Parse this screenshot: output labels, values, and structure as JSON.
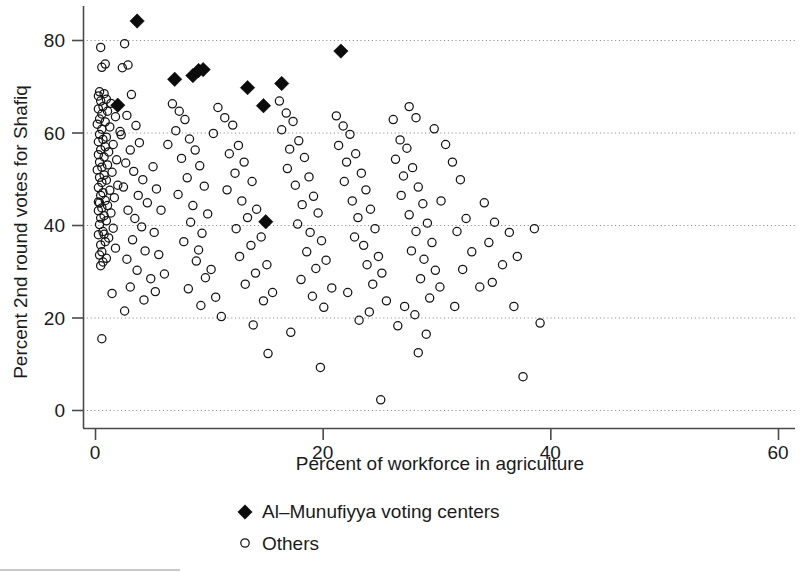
{
  "chart_data": {
    "type": "scatter",
    "title": "",
    "xlabel": "Percent of workforce in agriculture",
    "ylabel": "Percent 2nd round votes for Shafiq",
    "xlim": [
      0,
      60
    ],
    "ylim": [
      0,
      88
    ],
    "xticks": [
      0,
      20,
      40,
      60
    ],
    "yticks": [
      0,
      20,
      40,
      60,
      80
    ],
    "xtick_labels": [
      "0",
      "20",
      "40",
      "60"
    ],
    "ytick_labels": [
      "0",
      "20",
      "40",
      "60",
      "80"
    ],
    "grid": "horizontal-dotted",
    "legend_position": "below-axis-center",
    "series": [
      {
        "name": "Al–Munufiyya voting centers",
        "marker": "filled-diamond",
        "color": "#0b0b0b",
        "points": [
          [
            3.7,
            84.1
          ],
          [
            2.0,
            65.9
          ],
          [
            7.0,
            71.5
          ],
          [
            8.6,
            72.3
          ],
          [
            9.1,
            73.4
          ],
          [
            9.5,
            73.6
          ],
          [
            13.4,
            69.7
          ],
          [
            14.8,
            65.8
          ],
          [
            16.4,
            70.6
          ],
          [
            21.6,
            77.6
          ],
          [
            15.0,
            40.7
          ]
        ]
      },
      {
        "name": "Others",
        "marker": "open-circle",
        "color": "#141414",
        "points": [
          [
            0.5,
            78.4
          ],
          [
            0.9,
            74.8
          ],
          [
            0.6,
            74.1
          ],
          [
            0.4,
            68.8
          ],
          [
            0.8,
            68.4
          ],
          [
            0.3,
            67.9
          ],
          [
            1.0,
            67.2
          ],
          [
            0.5,
            66.8
          ],
          [
            1.4,
            66.3
          ],
          [
            0.7,
            65.6
          ],
          [
            0.3,
            65.1
          ],
          [
            1.1,
            64.6
          ],
          [
            0.6,
            64.0
          ],
          [
            1.8,
            63.4
          ],
          [
            0.4,
            62.9
          ],
          [
            0.9,
            62.3
          ],
          [
            0.2,
            61.8
          ],
          [
            1.3,
            61.2
          ],
          [
            0.6,
            60.7
          ],
          [
            2.2,
            60.2
          ],
          [
            0.4,
            59.6
          ],
          [
            1.0,
            59.0
          ],
          [
            0.7,
            58.5
          ],
          [
            0.3,
            58.0
          ],
          [
            1.6,
            57.4
          ],
          [
            0.9,
            56.9
          ],
          [
            0.5,
            56.3
          ],
          [
            1.2,
            55.8
          ],
          [
            0.3,
            55.2
          ],
          [
            0.8,
            54.7
          ],
          [
            1.9,
            54.1
          ],
          [
            0.4,
            53.6
          ],
          [
            1.1,
            53.0
          ],
          [
            0.6,
            52.5
          ],
          [
            0.2,
            51.9
          ],
          [
            1.5,
            51.4
          ],
          [
            0.8,
            50.8
          ],
          [
            0.4,
            50.3
          ],
          [
            1.0,
            49.7
          ],
          [
            0.6,
            49.2
          ],
          [
            2.0,
            48.6
          ],
          [
            0.3,
            48.1
          ],
          [
            1.3,
            47.5
          ],
          [
            0.7,
            47.0
          ],
          [
            0.5,
            46.4
          ],
          [
            1.7,
            45.9
          ],
          [
            0.9,
            45.3
          ],
          [
            0.4,
            44.8
          ],
          [
            1.1,
            44.2
          ],
          [
            0.6,
            43.7
          ],
          [
            0.3,
            43.1
          ],
          [
            1.4,
            42.6
          ],
          [
            0.8,
            42.0
          ],
          [
            0.5,
            41.5
          ],
          [
            1.0,
            40.9
          ],
          [
            0.4,
            40.1
          ],
          [
            1.6,
            39.3
          ],
          [
            0.7,
            38.6
          ],
          [
            0.3,
            37.9
          ],
          [
            1.2,
            37.2
          ],
          [
            0.9,
            36.4
          ],
          [
            0.5,
            35.7
          ],
          [
            1.8,
            35.0
          ],
          [
            0.6,
            34.2
          ],
          [
            0.4,
            33.5
          ],
          [
            1.0,
            32.8
          ],
          [
            0.7,
            32.0
          ],
          [
            0.3,
            45.0
          ],
          [
            0.8,
            38.0
          ],
          [
            0.5,
            31.2
          ],
          [
            0.6,
            15.4
          ],
          [
            1.5,
            25.2
          ],
          [
            2.6,
            79.2
          ],
          [
            2.9,
            74.6
          ],
          [
            2.4,
            74.0
          ],
          [
            3.2,
            68.2
          ],
          [
            2.8,
            63.7
          ],
          [
            3.6,
            61.5
          ],
          [
            2.3,
            59.5
          ],
          [
            3.9,
            57.8
          ],
          [
            3.1,
            56.2
          ],
          [
            2.7,
            53.4
          ],
          [
            3.4,
            51.6
          ],
          [
            4.2,
            49.8
          ],
          [
            2.5,
            48.2
          ],
          [
            3.8,
            46.4
          ],
          [
            4.6,
            44.8
          ],
          [
            2.9,
            43.2
          ],
          [
            3.5,
            41.4
          ],
          [
            4.1,
            39.6
          ],
          [
            3.3,
            36.8
          ],
          [
            4.4,
            34.4
          ],
          [
            2.8,
            32.6
          ],
          [
            3.7,
            30.2
          ],
          [
            4.9,
            28.4
          ],
          [
            3.1,
            26.6
          ],
          [
            4.3,
            23.8
          ],
          [
            2.6,
            21.4
          ],
          [
            5.1,
            52.6
          ],
          [
            5.4,
            47.8
          ],
          [
            5.8,
            43.2
          ],
          [
            5.2,
            38.4
          ],
          [
            5.6,
            33.6
          ],
          [
            6.1,
            29.4
          ],
          [
            5.3,
            25.6
          ],
          [
            6.4,
            57.4
          ],
          [
            6.8,
            66.2
          ],
          [
            7.4,
            64.6
          ],
          [
            7.9,
            62.8
          ],
          [
            7.1,
            60.4
          ],
          [
            8.3,
            58.6
          ],
          [
            8.8,
            56.2
          ],
          [
            7.6,
            54.4
          ],
          [
            9.2,
            52.8
          ],
          [
            8.1,
            50.2
          ],
          [
            9.6,
            48.4
          ],
          [
            7.3,
            46.6
          ],
          [
            8.6,
            44.2
          ],
          [
            9.9,
            42.4
          ],
          [
            8.4,
            40.6
          ],
          [
            9.4,
            38.2
          ],
          [
            7.8,
            36.4
          ],
          [
            9.1,
            34.6
          ],
          [
            8.9,
            32.2
          ],
          [
            10.2,
            30.4
          ],
          [
            9.7,
            28.6
          ],
          [
            8.2,
            26.2
          ],
          [
            10.6,
            24.4
          ],
          [
            9.3,
            22.6
          ],
          [
            11.1,
            20.2
          ],
          [
            10.8,
            65.4
          ],
          [
            11.4,
            63.2
          ],
          [
            12.1,
            61.6
          ],
          [
            10.4,
            59.8
          ],
          [
            12.6,
            57.2
          ],
          [
            11.8,
            55.4
          ],
          [
            13.1,
            53.6
          ],
          [
            12.3,
            51.2
          ],
          [
            13.8,
            49.4
          ],
          [
            11.6,
            47.6
          ],
          [
            12.9,
            45.2
          ],
          [
            14.2,
            43.4
          ],
          [
            13.4,
            41.6
          ],
          [
            12.4,
            39.2
          ],
          [
            14.6,
            37.4
          ],
          [
            13.7,
            35.6
          ],
          [
            12.7,
            33.2
          ],
          [
            15.1,
            31.4
          ],
          [
            14.1,
            29.6
          ],
          [
            13.2,
            27.2
          ],
          [
            15.6,
            25.4
          ],
          [
            14.8,
            23.6
          ],
          [
            13.9,
            18.4
          ],
          [
            15.2,
            12.2
          ],
          [
            16.2,
            66.8
          ],
          [
            16.8,
            64.2
          ],
          [
            17.4,
            62.4
          ],
          [
            16.4,
            60.6
          ],
          [
            17.9,
            58.2
          ],
          [
            17.1,
            56.4
          ],
          [
            18.4,
            54.6
          ],
          [
            16.9,
            52.2
          ],
          [
            18.8,
            50.4
          ],
          [
            17.6,
            48.6
          ],
          [
            19.2,
            46.2
          ],
          [
            18.2,
            44.4
          ],
          [
            19.6,
            42.6
          ],
          [
            17.8,
            40.2
          ],
          [
            18.9,
            38.4
          ],
          [
            19.9,
            36.6
          ],
          [
            18.6,
            34.2
          ],
          [
            20.3,
            32.4
          ],
          [
            19.4,
            30.6
          ],
          [
            18.1,
            28.2
          ],
          [
            20.8,
            26.4
          ],
          [
            19.1,
            24.6
          ],
          [
            20.1,
            22.2
          ],
          [
            17.2,
            16.8
          ],
          [
            19.8,
            9.2
          ],
          [
            21.2,
            63.6
          ],
          [
            21.8,
            61.4
          ],
          [
            22.4,
            59.6
          ],
          [
            21.4,
            57.2
          ],
          [
            22.9,
            55.4
          ],
          [
            22.1,
            53.6
          ],
          [
            23.4,
            51.2
          ],
          [
            21.9,
            49.4
          ],
          [
            23.8,
            47.6
          ],
          [
            22.6,
            45.2
          ],
          [
            24.2,
            43.4
          ],
          [
            23.1,
            41.6
          ],
          [
            24.6,
            39.2
          ],
          [
            22.8,
            37.4
          ],
          [
            23.6,
            35.6
          ],
          [
            24.9,
            33.2
          ],
          [
            23.9,
            31.4
          ],
          [
            25.2,
            29.6
          ],
          [
            24.4,
            27.2
          ],
          [
            22.2,
            25.4
          ],
          [
            25.6,
            23.6
          ],
          [
            24.1,
            21.2
          ],
          [
            23.2,
            19.4
          ],
          [
            25.1,
            2.2
          ],
          [
            26.2,
            62.8
          ],
          [
            26.8,
            58.4
          ],
          [
            27.4,
            56.6
          ],
          [
            26.4,
            54.2
          ],
          [
            27.9,
            52.4
          ],
          [
            27.1,
            50.6
          ],
          [
            28.4,
            48.2
          ],
          [
            26.9,
            46.4
          ],
          [
            28.8,
            44.6
          ],
          [
            27.6,
            42.2
          ],
          [
            29.2,
            40.4
          ],
          [
            28.2,
            38.6
          ],
          [
            29.6,
            36.2
          ],
          [
            27.8,
            34.4
          ],
          [
            28.9,
            32.6
          ],
          [
            29.9,
            30.2
          ],
          [
            28.6,
            28.4
          ],
          [
            30.3,
            26.6
          ],
          [
            29.4,
            24.2
          ],
          [
            27.2,
            22.4
          ],
          [
            28.1,
            20.6
          ],
          [
            26.6,
            18.2
          ],
          [
            29.1,
            16.4
          ],
          [
            28.4,
            12.4
          ],
          [
            27.6,
            65.6
          ],
          [
            28.2,
            63.2
          ],
          [
            29.8,
            60.8
          ],
          [
            30.8,
            57.4
          ],
          [
            31.4,
            53.6
          ],
          [
            32.1,
            49.8
          ],
          [
            30.4,
            45.2
          ],
          [
            32.6,
            41.4
          ],
          [
            31.8,
            38.6
          ],
          [
            33.1,
            34.2
          ],
          [
            32.3,
            30.4
          ],
          [
            33.8,
            26.6
          ],
          [
            31.6,
            22.4
          ],
          [
            34.2,
            44.8
          ],
          [
            35.1,
            40.6
          ],
          [
            34.6,
            36.2
          ],
          [
            35.8,
            31.4
          ],
          [
            34.9,
            27.6
          ],
          [
            36.4,
            38.4
          ],
          [
            37.1,
            33.2
          ],
          [
            36.8,
            22.4
          ],
          [
            37.6,
            7.2
          ],
          [
            38.6,
            39.2
          ],
          [
            39.1,
            18.8
          ]
        ]
      }
    ]
  },
  "legend": {
    "entries": [
      {
        "label": "Al–Munufiyya voting centers",
        "marker": "filled-diamond"
      },
      {
        "label": "Others",
        "marker": "open-circle"
      }
    ]
  }
}
